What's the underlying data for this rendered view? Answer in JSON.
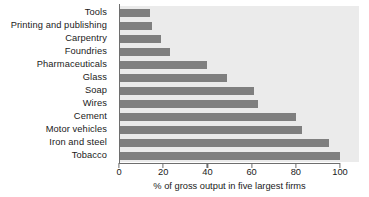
{
  "chart_data": {
    "type": "bar",
    "orientation": "horizontal",
    "title": "",
    "xlabel": "% of gross output in five largest firms",
    "ylabel": "",
    "xlim": [
      0,
      100
    ],
    "xticks": [
      0,
      20,
      40,
      60,
      80,
      100
    ],
    "grid": false,
    "legend": null,
    "plot_background": "#ebebeb",
    "bar_color": "#7f7f7f",
    "axis_color": "#6e6e6e",
    "categories": [
      "Tools",
      "Printing and publishing",
      "Carpentry",
      "Foundries",
      "Pharmaceuticals",
      "Glass",
      "Soap",
      "Wires",
      "Cement",
      "Motor vehicles",
      "Iron and steel",
      "Tobacco"
    ],
    "values": [
      14,
      15,
      19,
      23,
      40,
      49,
      61,
      63,
      80,
      83,
      95,
      100
    ]
  }
}
